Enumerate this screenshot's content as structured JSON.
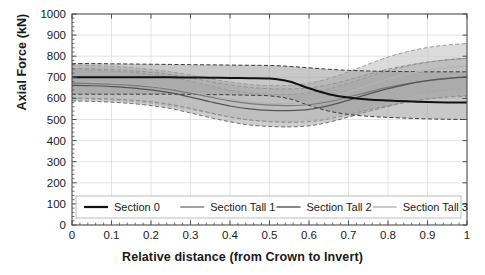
{
  "chart_data": {
    "type": "line",
    "title": "",
    "subtitle": "",
    "xlabel": "Relative distance (from Crown to Invert)",
    "ylabel": "Axial Force (kN)",
    "xlim": [
      0,
      1
    ],
    "ylim": [
      0,
      1000
    ],
    "xticks": [
      "0",
      "0.1",
      "0.2",
      "0.3",
      "0.4",
      "0.5",
      "0.6",
      "0.7",
      "0.8",
      "0.9",
      "1"
    ],
    "xtick_values": [
      0,
      0.1,
      0.2,
      0.3,
      0.4,
      0.5,
      0.6,
      0.7,
      0.8,
      0.9,
      1
    ],
    "yticks": [
      "0",
      "100",
      "200",
      "300",
      "400",
      "500",
      "600",
      "700",
      "800",
      "900",
      "1000"
    ],
    "ytick_values": [
      0,
      100,
      200,
      300,
      400,
      500,
      600,
      700,
      800,
      900,
      1000
    ],
    "grid": true,
    "minor_ticks": true,
    "legend_position": "lower left inside axes",
    "legend_orientation": "horizontal",
    "bands": "each series drawn with a shaded uncertainty band bounded by dashed lines",
    "x": [
      0,
      0.05,
      0.1,
      0.15,
      0.2,
      0.25,
      0.3,
      0.35,
      0.4,
      0.45,
      0.5,
      0.55,
      0.6,
      0.65,
      0.7,
      0.75,
      0.8,
      0.85,
      0.9,
      0.95,
      1
    ],
    "series": [
      {
        "name": "Section 0",
        "color": "#111111",
        "linewidth": 2.0,
        "values": [
          700,
          700,
          700,
          700,
          700,
          700,
          699,
          698,
          697,
          696,
          694,
          680,
          648,
          620,
          604,
          595,
          590,
          586,
          583,
          581,
          580
        ],
        "band_upper": [
          765,
          765,
          764,
          763,
          762,
          761,
          760,
          759,
          758,
          757,
          756,
          752,
          745,
          738,
          733,
          730,
          728,
          727,
          726,
          726,
          726
        ],
        "band_lower": [
          620,
          620,
          620,
          620,
          620,
          620,
          619,
          618,
          617,
          615,
          612,
          598,
          567,
          540,
          524,
          515,
          510,
          506,
          503,
          501,
          500
        ]
      },
      {
        "name": "Section Tall 1",
        "color": "#7a7a7a",
        "linewidth": 1.2,
        "values": [
          672,
          670,
          667,
          662,
          654,
          642,
          625,
          606,
          588,
          575,
          568,
          566,
          570,
          584,
          606,
          630,
          652,
          670,
          684,
          694,
          700
        ],
        "band_upper": [
          742,
          740,
          737,
          732,
          724,
          713,
          697,
          680,
          664,
          652,
          646,
          645,
          650,
          665,
          688,
          714,
          738,
          757,
          772,
          783,
          790
        ],
        "band_lower": [
          602,
          600,
          597,
          592,
          584,
          571,
          553,
          532,
          512,
          498,
          490,
          487,
          490,
          503,
          524,
          546,
          566,
          583,
          596,
          605,
          610
        ]
      },
      {
        "name": "Section Tall 2",
        "color": "#555555",
        "linewidth": 1.2,
        "values": [
          662,
          660,
          656,
          650,
          640,
          626,
          606,
          584,
          564,
          550,
          543,
          542,
          548,
          566,
          592,
          620,
          646,
          668,
          684,
          695,
          702
        ],
        "band_upper": [
          736,
          734,
          730,
          724,
          714,
          700,
          681,
          659,
          639,
          626,
          619,
          619,
          626,
          645,
          672,
          702,
          730,
          753,
          770,
          782,
          790
        ],
        "band_lower": [
          588,
          586,
          582,
          576,
          566,
          552,
          531,
          509,
          489,
          474,
          467,
          465,
          470,
          487,
          512,
          538,
          562,
          583,
          598,
          608,
          614
        ]
      },
      {
        "name": "Section Tall 3",
        "color": "#b4b4b4",
        "linewidth": 1.2,
        "values": [
          678,
          676,
          672,
          666,
          657,
          645,
          629,
          611,
          594,
          582,
          576,
          576,
          584,
          602,
          630,
          662,
          692,
          716,
          734,
          746,
          752
        ],
        "band_upper": [
          758,
          756,
          752,
          746,
          737,
          726,
          710,
          693,
          677,
          666,
          661,
          662,
          672,
          694,
          726,
          762,
          796,
          822,
          841,
          853,
          860
        ],
        "band_lower": [
          598,
          596,
          592,
          586,
          577,
          564,
          548,
          529,
          511,
          498,
          491,
          490,
          496,
          510,
          534,
          562,
          588,
          610,
          627,
          639,
          644
        ]
      }
    ]
  },
  "legend": {
    "items": [
      {
        "label": "Section 0",
        "color": "#111111"
      },
      {
        "label": "Section Tall 1",
        "color": "#7a7a7a"
      },
      {
        "label": "Section Tall 2",
        "color": "#555555"
      },
      {
        "label": "Section Tall 3",
        "color": "#b4b4b4"
      }
    ]
  },
  "axes": {
    "ylabel": "Axial Force (kN)",
    "xlabel": "Relative distance (from Crown to Invert)",
    "ytick_labels": [
      "1000",
      "900",
      "800",
      "700",
      "600",
      "500",
      "400",
      "300",
      "200",
      "100",
      "0"
    ],
    "xtick_labels": [
      "0",
      "0.1",
      "0.2",
      "0.3",
      "0.4",
      "0.5",
      "0.6",
      "0.7",
      "0.8",
      "0.9",
      "1"
    ]
  },
  "style": {
    "axis_color": "#4d4d4d",
    "grid_color": "#d8d8d8",
    "background": "#ffffff",
    "band_fill_light": "#c9c9c9",
    "band_fill_mid": "#a8a8a8",
    "band_fill_dark": "#8e8e8e"
  }
}
